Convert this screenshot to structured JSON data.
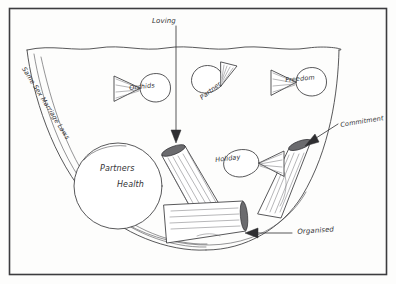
{
  "canvas": {
    "width": 396,
    "height": 284,
    "background_color": "#fdfdfc",
    "ink_color": "#3a3a3c",
    "frame_color": "#3c3c3f",
    "medium": "pencil-on-paper-sketch"
  },
  "title_annotations": {
    "top_arrow_label": "Loving",
    "right_arrow_label": "Commitment",
    "bottom_arrow_label": "Organised"
  },
  "vessel": {
    "label": "Same Sex Marriage Laws",
    "shape_name": "bowl-outline"
  },
  "oval": {
    "line1": "Partners",
    "line2": "Health"
  },
  "bowties": [
    {
      "label": "Orchids"
    },
    {
      "label": "Partner"
    },
    {
      "label": "Freedom"
    },
    {
      "label": "Holiday"
    }
  ],
  "logs": [
    {
      "name": "log-left"
    },
    {
      "name": "log-bottom"
    },
    {
      "name": "log-right"
    }
  ]
}
